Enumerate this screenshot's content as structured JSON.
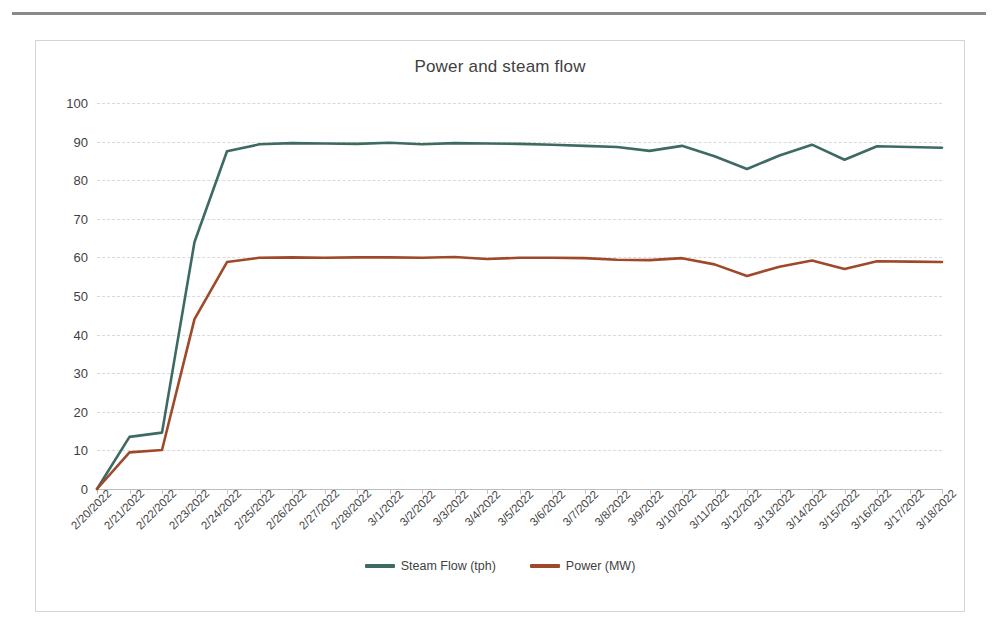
{
  "chart_data": {
    "type": "line",
    "title": "Power and steam flow",
    "xlabel": "",
    "ylabel": "",
    "ylim": [
      0,
      100
    ],
    "ytick_step": 10,
    "yticks": [
      0,
      10,
      20,
      30,
      40,
      50,
      60,
      70,
      80,
      90,
      100
    ],
    "grid": true,
    "legend_position": "bottom",
    "categories": [
      "2/20/2022",
      "2/21/2022",
      "2/22/2022",
      "2/23/2022",
      "2/24/2022",
      "2/25/2022",
      "2/26/2022",
      "2/27/2022",
      "2/28/2022",
      "3/1/2022",
      "3/2/2022",
      "3/3/2022",
      "3/4/2022",
      "3/5/2022",
      "3/6/2022",
      "3/7/2022",
      "3/8/2022",
      "3/9/2022",
      "3/10/2022",
      "3/11/2022",
      "3/12/2022",
      "3/13/2022",
      "3/14/2022",
      "3/15/2022",
      "3/16/2022",
      "3/17/2022",
      "3/18/2022"
    ],
    "series": [
      {
        "name": "Steam Flow (tph)",
        "color": "#3d6b63",
        "values": [
          0,
          13.5,
          14.6,
          64.0,
          87.5,
          89.3,
          89.6,
          89.5,
          89.4,
          89.7,
          89.3,
          89.6,
          89.5,
          89.4,
          89.2,
          88.9,
          88.6,
          87.6,
          88.9,
          86.2,
          82.9,
          86.4,
          89.2,
          85.3,
          88.8,
          88.6,
          88.4
        ]
      },
      {
        "name": "Power (MW)",
        "color": "#a0482a",
        "values": [
          0,
          9.5,
          10.1,
          44.0,
          58.8,
          59.9,
          60.0,
          59.9,
          60.0,
          60.0,
          59.9,
          60.1,
          59.6,
          59.9,
          59.9,
          59.8,
          59.4,
          59.3,
          59.8,
          58.2,
          55.2,
          57.6,
          59.2,
          57.0,
          59.0,
          58.9,
          58.8
        ]
      }
    ]
  },
  "legend": {
    "items": [
      {
        "label": "Steam Flow (tph)",
        "color": "#3d6b63"
      },
      {
        "label": "Power (MW)",
        "color": "#a0482a"
      }
    ]
  }
}
